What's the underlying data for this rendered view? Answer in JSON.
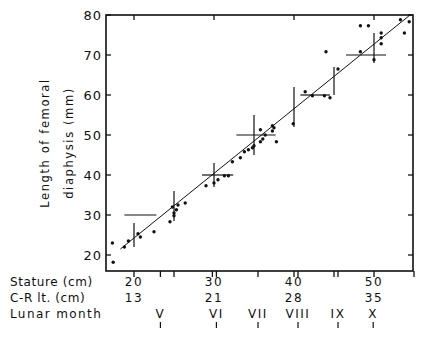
{
  "chart_data": {
    "type": "scatter",
    "title": "",
    "xlabel": "Stature (cm)",
    "ylabel": "Length of femoral diaphysis (mm)",
    "ylabel_lines": [
      "Length of femoral",
      "diaphysis (mm)"
    ],
    "xlim": [
      16.5,
      55
    ],
    "ylim": [
      16,
      80
    ],
    "grid": false,
    "legend": null,
    "y_ticks": [
      20,
      30,
      40,
      50,
      60,
      70,
      80
    ],
    "secondary_axes": [
      {
        "label": "Stature (cm)",
        "ticks": [
          {
            "at": 20,
            "text": "20"
          },
          {
            "at": 30,
            "text": "30"
          },
          {
            "at": 40,
            "text": "40"
          },
          {
            "at": 50,
            "text": "50"
          }
        ]
      },
      {
        "label": "C-R lt. (cm)",
        "ticks": [
          {
            "at": 20,
            "text": "13"
          },
          {
            "at": 30,
            "text": "21"
          },
          {
            "at": 40,
            "text": "28"
          },
          {
            "at": 50,
            "text": "35"
          }
        ]
      },
      {
        "label": "Lunar month",
        "ticks": [
          {
            "at": 23.3,
            "text": "V"
          },
          {
            "at": 30.3,
            "text": "VI"
          },
          {
            "at": 35.5,
            "text": "VII"
          },
          {
            "at": 40.5,
            "text": "VIII"
          },
          {
            "at": 45.5,
            "text": "IX"
          },
          {
            "at": 49.9,
            "text": "X"
          }
        ]
      }
    ],
    "bottom_axis_ticks": [
      20,
      23.3,
      25,
      29.8,
      30.3,
      35.5,
      40,
      40.5,
      45,
      45.5,
      50,
      55
    ],
    "top_axis_ticks": [
      20,
      30,
      40,
      50
    ],
    "regression_line": {
      "x": [
        18.3,
        54.5
      ],
      "y": [
        21.5,
        80
      ]
    },
    "points": [
      {
        "x": 17.3,
        "y": 23.0
      },
      {
        "x": 17.4,
        "y": 18.2
      },
      {
        "x": 18.8,
        "y": 22.0
      },
      {
        "x": 19.3,
        "y": 23.5
      },
      {
        "x": 20.5,
        "y": 25.3
      },
      {
        "x": 20.8,
        "y": 24.5
      },
      {
        "x": 22.5,
        "y": 25.8
      },
      {
        "x": 24.5,
        "y": 28.3
      },
      {
        "x": 25.0,
        "y": 29.8
      },
      {
        "x": 25.0,
        "y": 30.5
      },
      {
        "x": 25.3,
        "y": 31.3
      },
      {
        "x": 24.8,
        "y": 32.0
      },
      {
        "x": 25.5,
        "y": 32.5
      },
      {
        "x": 26.4,
        "y": 33.0
      },
      {
        "x": 29.0,
        "y": 37.3
      },
      {
        "x": 30.0,
        "y": 38.0
      },
      {
        "x": 30.5,
        "y": 38.8
      },
      {
        "x": 31.3,
        "y": 39.8
      },
      {
        "x": 31.8,
        "y": 39.8
      },
      {
        "x": 32.3,
        "y": 43.3
      },
      {
        "x": 33.3,
        "y": 44.3
      },
      {
        "x": 33.8,
        "y": 45.8
      },
      {
        "x": 34.3,
        "y": 46.3
      },
      {
        "x": 34.8,
        "y": 46.8
      },
      {
        "x": 35.0,
        "y": 47.3
      },
      {
        "x": 35.8,
        "y": 48.3
      },
      {
        "x": 36.1,
        "y": 49.0
      },
      {
        "x": 36.4,
        "y": 50.0
      },
      {
        "x": 37.3,
        "y": 51.0
      },
      {
        "x": 37.5,
        "y": 51.8
      },
      {
        "x": 37.3,
        "y": 52.3
      },
      {
        "x": 35.8,
        "y": 51.3
      },
      {
        "x": 37.8,
        "y": 48.3
      },
      {
        "x": 39.9,
        "y": 52.8
      },
      {
        "x": 41.4,
        "y": 60.8
      },
      {
        "x": 42.3,
        "y": 59.8
      },
      {
        "x": 43.8,
        "y": 59.8
      },
      {
        "x": 44.5,
        "y": 59.3
      },
      {
        "x": 44.0,
        "y": 70.8
      },
      {
        "x": 45.5,
        "y": 66.5
      },
      {
        "x": 48.3,
        "y": 70.8
      },
      {
        "x": 50.9,
        "y": 72.8
      },
      {
        "x": 50.9,
        "y": 74.3
      },
      {
        "x": 50.9,
        "y": 75.5
      },
      {
        "x": 50.0,
        "y": 68.8
      },
      {
        "x": 48.3,
        "y": 77.3
      },
      {
        "x": 49.3,
        "y": 77.3
      },
      {
        "x": 53.3,
        "y": 78.8
      },
      {
        "x": 54.4,
        "y": 78.3
      },
      {
        "x": 53.8,
        "y": 75.5
      }
    ],
    "vertical_range_bars": [
      {
        "x": 20,
        "y1": 22,
        "y2": 28
      },
      {
        "x": 25,
        "y1": 28.5,
        "y2": 36
      },
      {
        "x": 30,
        "y1": 37,
        "y2": 43
      },
      {
        "x": 35,
        "y1": 45,
        "y2": 55
      },
      {
        "x": 40,
        "y1": 52,
        "y2": 62
      },
      {
        "x": 45,
        "y1": 60,
        "y2": 67
      },
      {
        "x": 50,
        "y1": 68,
        "y2": 75.5
      }
    ],
    "horizontal_range_bars": [
      {
        "y": 30,
        "x1": 18.8,
        "x2": 22.8
      },
      {
        "y": 40,
        "x1": 28.5,
        "x2": 32.4
      },
      {
        "y": 50,
        "x1": 32.8,
        "x2": 37.7
      },
      {
        "y": 60,
        "x1": 40.8,
        "x2": 44.5
      },
      {
        "y": 70,
        "x1": 46.5,
        "x2": 51.5
      }
    ]
  },
  "labels": {
    "ylabel_line1": "Length of femoral",
    "ylabel_line2": "diaphysis (mm)",
    "row1": "Stature (cm)",
    "row2": "C-R lt. (cm)",
    "row3": "Lunar month"
  }
}
